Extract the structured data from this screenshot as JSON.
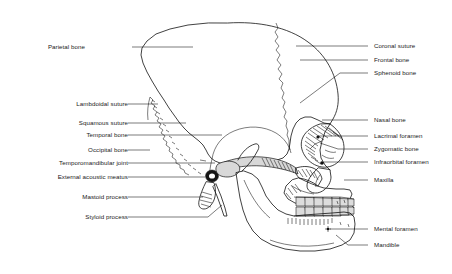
{
  "figure": {
    "background_color": "#ffffff",
    "line_color": "#111111",
    "label_color": "#1a1a1a"
  },
  "labels_left": [
    {
      "text": "Parietal bone",
      "x": 85,
      "y": 47,
      "leader_to_x": 193,
      "leader_to_y": 47,
      "kink_x": 0,
      "kink_y": 0
    },
    {
      "text": "Lambdoidal suture",
      "x": 118,
      "y": 104,
      "leader_to_x": 158,
      "leader_to_y": 104,
      "kink_x": 0,
      "kink_y": 0
    },
    {
      "text": "Squamous suture",
      "x": 118,
      "y": 123,
      "leader_to_x": 186,
      "leader_to_y": 123,
      "kink_x": 0,
      "kink_y": 0
    },
    {
      "text": "Temporal bone",
      "x": 118,
      "y": 135,
      "leader_to_x": 222,
      "leader_to_y": 135,
      "kink_x": 0,
      "kink_y": 0
    },
    {
      "text": "Occipital bone",
      "x": 118,
      "y": 150,
      "leader_to_x": 150,
      "leader_to_y": 150,
      "kink_x": 0,
      "kink_y": 0
    },
    {
      "text": "Temporomandibular joint",
      "x": 118,
      "y": 163,
      "leader_to_x": 215,
      "leader_to_y": 163,
      "kink_x": 0,
      "kink_y": 0
    },
    {
      "text": "External acoustic meatus",
      "x": 118,
      "y": 177,
      "leader_to_x": 205,
      "leader_to_y": 177,
      "kink_x": 0,
      "kink_y": 0
    },
    {
      "text": "Mastoid process",
      "x": 118,
      "y": 197,
      "leader_to_x": 203,
      "leader_to_y": 197,
      "kink_x": 0,
      "kink_y": 0
    },
    {
      "text": "Styloid process",
      "x": 118,
      "y": 217,
      "leader_to_x": 210,
      "leader_to_y": 217,
      "kink_x": 0,
      "kink_y": 0
    }
  ],
  "labels_right": [
    {
      "text": "Coronal suture",
      "x": 374,
      "y": 46
    },
    {
      "text": "Frontal bone",
      "x": 374,
      "y": 60
    },
    {
      "text": "Sphenoid bone",
      "x": 374,
      "y": 73
    },
    {
      "text": "Nasal bone",
      "x": 374,
      "y": 120
    },
    {
      "text": "Lacrimal foramen",
      "x": 374,
      "y": 136
    },
    {
      "text": "Zygomatic bone",
      "x": 374,
      "y": 149
    },
    {
      "text": "Infraorbital foramen",
      "x": 374,
      "y": 162
    },
    {
      "text": "Maxilla",
      "x": 374,
      "y": 180
    },
    {
      "text": "Mental foramen",
      "x": 374,
      "y": 229
    },
    {
      "text": "Mandible",
      "x": 374,
      "y": 245
    }
  ]
}
